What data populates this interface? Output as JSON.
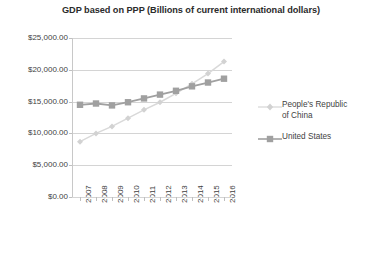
{
  "chart_data": {
    "type": "line",
    "title": "GDP based on PPP (Billions of current international dollars)",
    "xlabel": "",
    "ylabel": "",
    "categories": [
      "2007",
      "2008",
      "2009",
      "2010",
      "2011",
      "2012",
      "2013",
      "2014",
      "2015",
      "2016"
    ],
    "series": [
      {
        "name": "People's Republic of China",
        "color": "#d9d9d9",
        "marker": "diamond",
        "values": [
          8700,
          10000,
          11100,
          12400,
          13700,
          14900,
          16300,
          17800,
          19400,
          21300
        ]
      },
      {
        "name": "United States",
        "color": "#a0a0a0",
        "marker": "square",
        "values": [
          14500,
          14700,
          14400,
          14900,
          15500,
          16100,
          16700,
          17400,
          18000,
          18600
        ]
      }
    ],
    "ylim": [
      0,
      25000
    ],
    "ytick_values": [
      0,
      5000,
      10000,
      15000,
      20000,
      25000
    ],
    "ytick_labels": [
      "$0.00",
      "$5,000.00",
      "$10,000.00",
      "$15,000.00",
      "$20,000.00",
      "$25,000.00"
    ],
    "grid": true,
    "legend_position": "right"
  },
  "legend": {
    "items": [
      {
        "label_line1": "People's Republic",
        "label_line2": "of China"
      },
      {
        "label_line1": "United States",
        "label_line2": ""
      }
    ]
  },
  "colors": {
    "china_line": "#d9d9d9",
    "us_line": "#a0a0a0",
    "gridline": "#d4d4d4",
    "axis": "#c8c8c8",
    "text": "#3f3f3f",
    "title": "#2b2b2b"
  }
}
